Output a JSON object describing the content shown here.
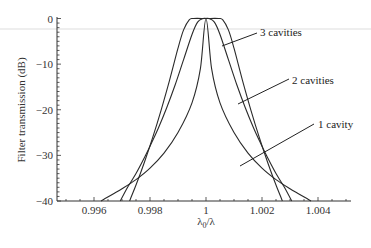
{
  "chart_data": {
    "type": "line",
    "title": "",
    "xlabel": "λ0/λ",
    "ylabel": "Filter transmission (dB)",
    "xlim": [
      0.9948,
      1.0052
    ],
    "ylim": [
      -40,
      0
    ],
    "x_ticks": [
      0.996,
      0.998,
      1,
      1.002,
      1.004
    ],
    "x_tick_labels": [
      "0.996",
      "0.998",
      "1",
      "1.002",
      "1.004"
    ],
    "y_ticks": [
      0,
      -10,
      -20,
      -30,
      -40
    ],
    "y_tick_labels": [
      "0",
      "−10",
      "−20",
      "−30",
      "−40"
    ],
    "grid": false,
    "legend_position": "inline-annotations-right",
    "series": [
      {
        "name": "1 cavity",
        "x": [
          0.99625,
          0.997,
          0.9975,
          0.998,
          0.9985,
          0.999,
          0.9995,
          0.9998,
          1.0,
          1.0002,
          1.0005,
          1.001,
          1.0015,
          1.002,
          1.0025,
          1.003,
          1.00375
        ],
        "y": [
          -40,
          -37.3,
          -35.3,
          -32.8,
          -29.5,
          -25,
          -18.5,
          -11,
          0,
          -11,
          -18.5,
          -25,
          -29.5,
          -32.8,
          -35.3,
          -37.3,
          -40
        ]
      },
      {
        "name": "2 cavities",
        "x": [
          0.99694,
          0.9972,
          0.9975,
          0.9978,
          0.998,
          0.9983,
          0.9986,
          0.9989,
          0.9992,
          0.9995,
          0.9997,
          0.9999,
          1.0,
          1.0001,
          1.0003,
          1.0005,
          1.0008,
          1.0011,
          1.0014,
          1.0017,
          1.002,
          1.0022,
          1.0025,
          1.0028,
          1.00306
        ],
        "y": [
          -40,
          -37,
          -34,
          -30.5,
          -28,
          -24,
          -19.5,
          -14.5,
          -9,
          -3.5,
          -0.8,
          0,
          0,
          0,
          -0.8,
          -3.5,
          -9,
          -14.5,
          -19.5,
          -24,
          -28,
          -30.5,
          -34,
          -37,
          -40
        ]
      },
      {
        "name": "3 cavities",
        "x": [
          0.99727,
          0.9975,
          0.9978,
          0.9981,
          0.9984,
          0.9987,
          0.999,
          0.9992,
          0.9994,
          0.99955,
          1.0,
          1.00045,
          1.0006,
          1.0008,
          1.001,
          1.0013,
          1.0016,
          1.0019,
          1.0022,
          1.0025,
          1.00273
        ],
        "y": [
          -40,
          -36.5,
          -31.5,
          -26,
          -20,
          -13.5,
          -6.5,
          -2.5,
          -0.3,
          0,
          0,
          0,
          -0.3,
          -2.5,
          -6.5,
          -13.5,
          -20,
          -26,
          -31.5,
          -36.5,
          -40
        ]
      }
    ],
    "annotations": [
      {
        "text": "3 cavities",
        "points_to": [
          1.00065,
          -3
        ]
      },
      {
        "text": "2 cavities",
        "points_to": [
          1.0008,
          -13
        ]
      },
      {
        "text": "1 cavity",
        "points_to": [
          1.0008,
          -26.5
        ]
      }
    ]
  }
}
